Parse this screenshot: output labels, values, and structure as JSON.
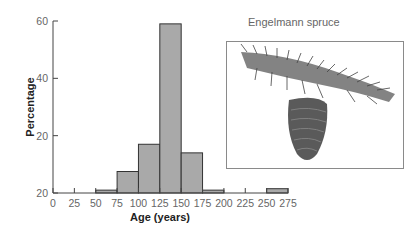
{
  "chart_data": {
    "type": "bar",
    "title": "",
    "xlabel": "Age (years)",
    "ylabel": "Percentage",
    "x_ticks": [
      "0",
      "25",
      "50",
      "75",
      "100",
      "125",
      "150",
      "175",
      "200",
      "225",
      "250",
      "275"
    ],
    "y_ticks": [
      "20",
      "20",
      "40",
      "60"
    ],
    "y_tick_values": [
      0,
      20,
      40,
      60
    ],
    "ylim": [
      0,
      60
    ],
    "xlim": [
      0,
      275
    ],
    "bins": [
      {
        "start": 50,
        "end": 75,
        "value": 1
      },
      {
        "start": 75,
        "end": 100,
        "value": 7.5
      },
      {
        "start": 100,
        "end": 125,
        "value": 17
      },
      {
        "start": 125,
        "end": 150,
        "value": 59
      },
      {
        "start": 150,
        "end": 175,
        "value": 14
      },
      {
        "start": 175,
        "end": 200,
        "value": 1
      },
      {
        "start": 250,
        "end": 275,
        "value": 1.5
      }
    ],
    "bar_color": "#a9a9a9",
    "bar_edge_color": "#333333",
    "grid": false,
    "legend": null
  },
  "inset": {
    "title": "Engelmann spruce",
    "image": "spruce-branch-with-cone-illustration"
  }
}
